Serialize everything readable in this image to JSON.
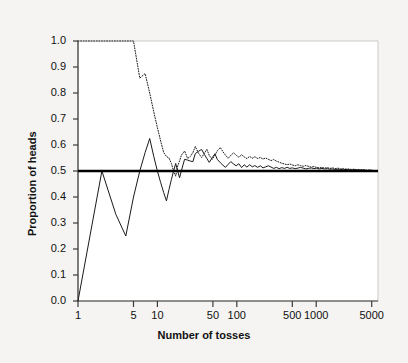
{
  "chart_data": {
    "type": "line",
    "title": "",
    "xlabel": "Number of tosses",
    "ylabel": "Proportion of heads",
    "xscale": "log",
    "xlim": [
      1,
      6000
    ],
    "ylim": [
      0.0,
      1.0
    ],
    "grid": false,
    "legend": "none",
    "xticks": [
      1,
      5,
      10,
      50,
      100,
      500,
      1000,
      5000
    ],
    "xtick_labels": [
      "1",
      "5",
      "10",
      "50",
      "100",
      "500",
      "1000",
      "5000"
    ],
    "yticks": [
      0.0,
      0.1,
      0.2,
      0.3,
      0.4,
      0.5,
      0.6,
      0.7,
      0.8,
      0.9,
      1.0
    ],
    "ytick_labels": [
      "0.0",
      "0.1",
      "0.2",
      "0.3",
      "0.4",
      "0.5",
      "0.6",
      "0.7",
      "0.8",
      "0.9",
      "1.0"
    ],
    "reference_line": {
      "name": "expected proportion",
      "orientation": "horizontal",
      "y": 0.5,
      "color": "#000000",
      "width": 2.5
    },
    "series": [
      {
        "name": "trial-1-solid",
        "style": "solid",
        "color": "#1a1a1a",
        "width": 1.0,
        "x": [
          1,
          2,
          3,
          4,
          5,
          6,
          7,
          8,
          9,
          10,
          11,
          12,
          13,
          14,
          15,
          16,
          17,
          18,
          19,
          20,
          22,
          24,
          26,
          28,
          30,
          33,
          36,
          39,
          42,
          45,
          49,
          53,
          57,
          62,
          67,
          72,
          78,
          84,
          91,
          98,
          106,
          115,
          124,
          134,
          145,
          157,
          169,
          183,
          198,
          214,
          231,
          250,
          270,
          292,
          315,
          341,
          368,
          398,
          430,
          465,
          502,
          543,
          587,
          634,
          685,
          740,
          800,
          864,
          934,
          1010,
          1091,
          1179,
          1274,
          1377,
          1488,
          1608,
          1738,
          1878,
          2030,
          2193,
          2370,
          2561,
          2767,
          2991,
          3232,
          3493,
          3774,
          4078,
          4407,
          4762,
          5000
        ],
        "y": [
          0.0,
          0.5,
          0.333,
          0.25,
          0.4,
          0.5,
          0.571,
          0.625,
          0.556,
          0.5,
          0.455,
          0.417,
          0.385,
          0.429,
          0.467,
          0.5,
          0.529,
          0.5,
          0.474,
          0.5,
          0.545,
          0.542,
          0.538,
          0.536,
          0.567,
          0.576,
          0.583,
          0.564,
          0.548,
          0.533,
          0.551,
          0.566,
          0.544,
          0.532,
          0.522,
          0.514,
          0.526,
          0.536,
          0.527,
          0.52,
          0.528,
          0.513,
          0.524,
          0.515,
          0.524,
          0.516,
          0.521,
          0.514,
          0.52,
          0.512,
          0.516,
          0.52,
          0.515,
          0.51,
          0.514,
          0.509,
          0.513,
          0.51,
          0.514,
          0.51,
          0.512,
          0.509,
          0.511,
          0.514,
          0.511,
          0.508,
          0.51,
          0.512,
          0.509,
          0.511,
          0.508,
          0.51,
          0.508,
          0.509,
          0.507,
          0.508,
          0.506,
          0.507,
          0.506,
          0.505,
          0.506,
          0.505,
          0.504,
          0.505,
          0.504,
          0.503,
          0.504,
          0.503,
          0.502,
          0.503,
          0.502
        ]
      },
      {
        "name": "trial-2-dotted",
        "style": "dotted",
        "color": "#1a1a1a",
        "width": 1.0,
        "x": [
          1,
          2,
          3,
          4,
          5,
          6,
          7,
          8,
          9,
          10,
          11,
          12,
          13,
          14,
          15,
          16,
          17,
          18,
          19,
          20,
          22,
          24,
          26,
          28,
          30,
          33,
          36,
          39,
          42,
          45,
          49,
          53,
          57,
          62,
          67,
          72,
          78,
          84,
          91,
          98,
          106,
          115,
          124,
          134,
          145,
          157,
          169,
          183,
          198,
          214,
          231,
          250,
          270,
          292,
          315,
          341,
          368,
          398,
          430,
          465,
          502,
          543,
          587,
          634,
          685,
          740,
          800,
          864,
          934,
          1010,
          1091,
          1179,
          1274,
          1377,
          1488,
          1608,
          1738,
          1878,
          2030,
          2193,
          2370,
          2561,
          2767,
          2991,
          3232,
          3493,
          3774,
          4078,
          4407,
          4762,
          5000
        ],
        "y": [
          1.0,
          1.0,
          1.0,
          1.0,
          1.0,
          0.857,
          0.875,
          0.8,
          0.727,
          0.667,
          0.615,
          0.571,
          0.556,
          0.55,
          0.529,
          0.5,
          0.48,
          0.519,
          0.538,
          0.56,
          0.577,
          0.548,
          0.556,
          0.571,
          0.594,
          0.568,
          0.552,
          0.568,
          0.583,
          0.56,
          0.545,
          0.561,
          0.578,
          0.59,
          0.574,
          0.561,
          0.549,
          0.56,
          0.57,
          0.561,
          0.553,
          0.562,
          0.554,
          0.548,
          0.556,
          0.549,
          0.555,
          0.548,
          0.552,
          0.546,
          0.55,
          0.545,
          0.54,
          0.544,
          0.538,
          0.534,
          0.53,
          0.527,
          0.524,
          0.527,
          0.523,
          0.52,
          0.524,
          0.521,
          0.518,
          0.521,
          0.518,
          0.515,
          0.517,
          0.514,
          0.512,
          0.514,
          0.511,
          0.513,
          0.51,
          0.512,
          0.509,
          0.511,
          0.508,
          0.51,
          0.507,
          0.508,
          0.506,
          0.507,
          0.505,
          0.506,
          0.504,
          0.505,
          0.503,
          0.504,
          0.503
        ]
      }
    ],
    "annotations": []
  },
  "axis": {
    "x_title": "Number of tosses",
    "y_title": "Proportion of heads"
  },
  "colors": {
    "background": "#f5f4f2",
    "plot_background": "#ffffff",
    "ink": "#111111"
  }
}
